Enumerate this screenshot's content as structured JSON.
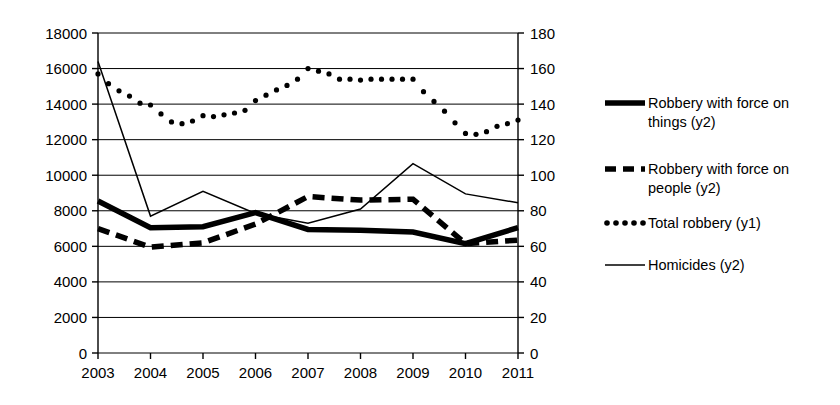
{
  "chart_data": {
    "type": "line",
    "title": "",
    "subtitle": "",
    "xlabel": "",
    "ylabel": "",
    "grid": true,
    "legend_position": "right",
    "x": [
      2003,
      2004,
      2005,
      2006,
      2007,
      2008,
      2009,
      2010,
      2011
    ],
    "x_tick_labels": [
      "2003",
      "2004",
      "2005",
      "2006",
      "2007",
      "2008",
      "2009",
      "2010",
      "2011"
    ],
    "axes": {
      "y1": {
        "name": "y1",
        "side": "left",
        "ylim": [
          0,
          18000
        ],
        "tick_step": 2000,
        "tick_labels": [
          "0",
          "2000",
          "4000",
          "6000",
          "8000",
          "10000",
          "12000",
          "14000",
          "16000",
          "18000"
        ],
        "tick_values": [
          0,
          2000,
          4000,
          6000,
          8000,
          10000,
          12000,
          14000,
          16000,
          18000
        ]
      },
      "y2": {
        "name": "y2",
        "side": "right",
        "ylim": [
          0,
          180
        ],
        "tick_step": 20,
        "tick_labels": [
          "0",
          "20",
          "40",
          "60",
          "80",
          "100",
          "120",
          "140",
          "160",
          "180"
        ],
        "tick_values": [
          0,
          20,
          40,
          60,
          80,
          100,
          120,
          140,
          160,
          180
        ]
      }
    },
    "series": [
      {
        "name": "Robbery with force on things (y2)",
        "legend_label_line1": "Robbery with force on",
        "legend_label_line2": "things (y2)",
        "axis": "y2",
        "style": "thick-solid",
        "color": "#000000",
        "values": [
          85.5,
          70.5,
          71.0,
          79.0,
          69.5,
          69.0,
          68.0,
          61.5,
          70.5
        ]
      },
      {
        "name": "Robbery with force on people (y2)",
        "legend_label_line1": "Robbery with force on",
        "legend_label_line2": "people (y2)",
        "axis": "y2",
        "style": "dashed",
        "color": "#000000",
        "values": [
          70.0,
          59.5,
          62.0,
          72.5,
          88.0,
          86.0,
          86.5,
          61.5,
          63.5
        ]
      },
      {
        "name": "Total robbery (y1)",
        "legend_label_line1": "Total robbery (y1)",
        "legend_label_line2": "",
        "axis": "y1",
        "style": "dotted",
        "color": "#000000",
        "values": [
          15700,
          13950,
          13350,
          14200,
          16000,
          15350,
          15400,
          12350,
          13100
        ],
        "dense_points": [
          [
            2003.0,
            15700
          ],
          [
            2003.2,
            15150
          ],
          [
            2003.4,
            14750
          ],
          [
            2003.6,
            14450
          ],
          [
            2003.8,
            14050
          ],
          [
            2004.0,
            13950
          ],
          [
            2004.2,
            13450
          ],
          [
            2004.4,
            13000
          ],
          [
            2004.6,
            12900
          ],
          [
            2004.8,
            13050
          ],
          [
            2005.0,
            13350
          ],
          [
            2005.2,
            13300
          ],
          [
            2005.4,
            13400
          ],
          [
            2005.6,
            13500
          ],
          [
            2005.8,
            13650
          ],
          [
            2006.0,
            14200
          ],
          [
            2006.2,
            14500
          ],
          [
            2006.4,
            14800
          ],
          [
            2006.6,
            15050
          ],
          [
            2006.8,
            15400
          ],
          [
            2007.0,
            16000
          ],
          [
            2007.2,
            15850
          ],
          [
            2007.4,
            15700
          ],
          [
            2007.6,
            15400
          ],
          [
            2007.8,
            15400
          ],
          [
            2008.0,
            15350
          ],
          [
            2008.2,
            15400
          ],
          [
            2008.4,
            15400
          ],
          [
            2008.6,
            15400
          ],
          [
            2008.8,
            15400
          ],
          [
            2009.0,
            15400
          ],
          [
            2009.2,
            14700
          ],
          [
            2009.4,
            14150
          ],
          [
            2009.6,
            13600
          ],
          [
            2009.8,
            12950
          ],
          [
            2010.0,
            12350
          ],
          [
            2010.2,
            12300
          ],
          [
            2010.4,
            12450
          ],
          [
            2010.6,
            12750
          ],
          [
            2010.8,
            12900
          ],
          [
            2011.0,
            13100
          ]
        ]
      },
      {
        "name": "Homicides (y2)",
        "legend_label_line1": "Homicides (y2)",
        "legend_label_line2": "",
        "axis": "y2",
        "style": "thin-solid",
        "color": "#000000",
        "values": [
          164.0,
          77.0,
          91.0,
          78.5,
          73.0,
          81.0,
          106.5,
          89.5,
          84.5
        ]
      }
    ]
  },
  "legend": {
    "entries": [
      {
        "label_line1": "Robbery with force on",
        "label_line2": "things (y2)",
        "marker": "thick-solid-line-swatch"
      },
      {
        "label_line1": "Robbery with force on",
        "label_line2": "people (y2)",
        "marker": "dashed-line-swatch"
      },
      {
        "label_line1": "Total robbery (y1)",
        "label_line2": "",
        "marker": "dotted-line-swatch"
      },
      {
        "label_line1": "Homicides (y2)",
        "label_line2": "",
        "marker": "thin-solid-line-swatch"
      }
    ]
  }
}
